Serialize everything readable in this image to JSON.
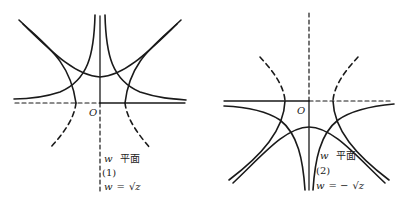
{
  "figures": [
    {
      "id": "fig1",
      "origin_label": "O",
      "plane_label_var": "w",
      "plane_label_text": "平面",
      "number": "(1)",
      "formula": "w=√z",
      "formula_var": "w",
      "formula_eq": "=",
      "formula_rhs": "√z"
    },
    {
      "id": "fig2",
      "origin_label": "O",
      "plane_label_var": "w",
      "plane_label_text": "平面",
      "number": "(2)",
      "formula": "w=−√z",
      "formula_var": "w",
      "formula_eq": "= −",
      "formula_rhs": "√z"
    }
  ],
  "colors": {
    "stroke": "#1a1a1a",
    "background": "#ffffff"
  }
}
